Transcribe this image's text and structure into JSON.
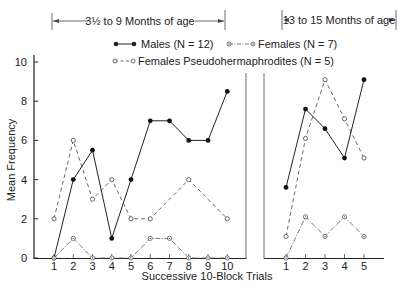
{
  "chart_data": {
    "type": "line",
    "title": "",
    "xlabel": "Successive 10-Block Trials",
    "ylabel": "Mean Frequency",
    "ylim": [
      0,
      11
    ],
    "yticks": [
      0,
      2,
      4,
      6,
      8,
      10
    ],
    "grid": false,
    "legend": {
      "position": "top-center",
      "entries": [
        {
          "name": "Males (N = 12)",
          "style": "solid",
          "marker": "filled-circle"
        },
        {
          "name": "Females (N = 7)",
          "style": "dash-dot",
          "marker": "dotted-circle"
        },
        {
          "name": "Females Pseudohermaphrodites (N = 5)",
          "style": "dashed",
          "marker": "open-circle"
        }
      ]
    },
    "panels": [
      {
        "annotation": "3½ to 9 Months of age",
        "x": [
          1,
          2,
          3,
          4,
          5,
          6,
          7,
          8,
          9,
          10
        ],
        "series": [
          {
            "name": "Males (N = 12)",
            "values": [
              0,
              4,
              5.5,
              1,
              4,
              7,
              7,
              6,
              6,
              8.5
            ],
            "markers": [
              1,
              1,
              1,
              1,
              1,
              1,
              1,
              1,
              1,
              1
            ]
          },
          {
            "name": "Females (N = 7)",
            "values": [
              0,
              1,
              0,
              0,
              0,
              1,
              1,
              0,
              0,
              0
            ],
            "markers": [
              1,
              1,
              1,
              1,
              1,
              1,
              1,
              1,
              1,
              1
            ]
          },
          {
            "name": "Females Pseudohermaphrodites (N = 5)",
            "values": [
              2,
              6,
              3,
              4,
              2,
              2,
              3,
              4,
              3,
              2
            ],
            "markers": [
              1,
              1,
              1,
              1,
              1,
              1,
              0,
              1,
              0,
              1
            ]
          }
        ]
      },
      {
        "annotation": "13 to 15 Months of age",
        "x": [
          1,
          2,
          3,
          4,
          5
        ],
        "series": [
          {
            "name": "Males (N = 12)",
            "values": [
              3.6,
              7.6,
              6.6,
              5.1,
              9.1
            ],
            "markers": [
              1,
              1,
              1,
              1,
              1
            ]
          },
          {
            "name": "Females (N = 7)",
            "values": [
              0,
              2.1,
              1.1,
              2.1,
              1.1
            ],
            "markers": [
              1,
              1,
              1,
              1,
              1
            ]
          },
          {
            "name": "Females Pseudohermaphrodites (N = 5)",
            "values": [
              1.1,
              6.1,
              9.1,
              7.1,
              5.1
            ],
            "markers": [
              1,
              1,
              1,
              1,
              1
            ]
          }
        ]
      }
    ]
  },
  "colors": {
    "ink": "#222222",
    "background": "#ffffff"
  }
}
